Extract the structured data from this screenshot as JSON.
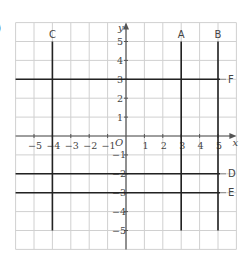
{
  "label_fragment": ")",
  "chart_data": {
    "type": "line",
    "title": "",
    "xlabel": "x",
    "ylabel": "y",
    "origin_label": "O",
    "xlim": [
      -6,
      6
    ],
    "ylim": [
      -6,
      6
    ],
    "grid": true,
    "x_ticks": [
      -5,
      -4,
      -3,
      -2,
      -1,
      1,
      2,
      3,
      4,
      5
    ],
    "y_ticks": [
      5,
      4,
      3,
      2,
      1,
      -1,
      -2,
      -3,
      -4,
      -5
    ],
    "lines": [
      {
        "name": "A",
        "orientation": "vertical",
        "equation": "x = 3",
        "value": 3,
        "from": -5,
        "to": 5
      },
      {
        "name": "B",
        "orientation": "vertical",
        "equation": "x = 5",
        "value": 5,
        "from": -5,
        "to": 5
      },
      {
        "name": "C",
        "orientation": "vertical",
        "equation": "x = -4",
        "value": -4,
        "from": -5,
        "to": 5
      },
      {
        "name": "D",
        "orientation": "horizontal",
        "equation": "y = -2",
        "value": -2,
        "from": -6,
        "to": 5
      },
      {
        "name": "E",
        "orientation": "horizontal",
        "equation": "y = -3",
        "value": -3,
        "from": -6,
        "to": 5
      },
      {
        "name": "F",
        "orientation": "horizontal",
        "equation": "y = 3",
        "value": 3,
        "from": -6,
        "to": 5
      }
    ]
  },
  "colors": {
    "grid": "#d0d0d0",
    "line": "#222222",
    "text": "#444444"
  }
}
